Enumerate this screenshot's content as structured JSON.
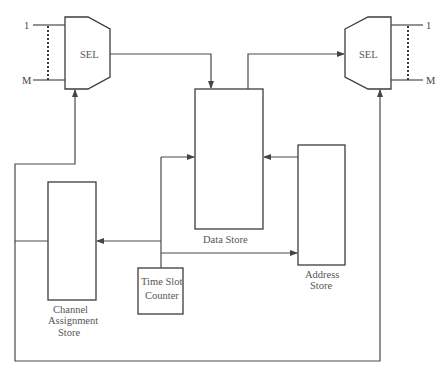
{
  "diagram": {
    "left_selector": {
      "label": "SEL",
      "input_first": "1",
      "input_last": "M"
    },
    "right_selector": {
      "label": "SEL",
      "output_first": "1",
      "output_last": "M"
    },
    "data_store": {
      "label": "Data Store"
    },
    "address_store": {
      "label_line1": "Address",
      "label_line2": "Store"
    },
    "channel_assignment_store": {
      "label_line1": "Channel",
      "label_line2": "Assignment",
      "label_line3": "Store"
    },
    "time_slot_counter": {
      "label_line1": "Time Slot",
      "label_line2": "Counter"
    }
  }
}
